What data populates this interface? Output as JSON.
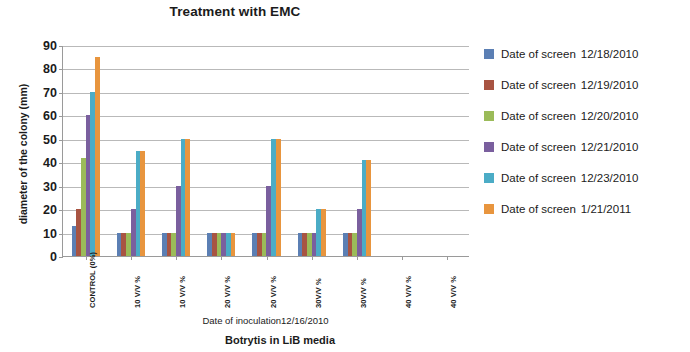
{
  "chart_data": {
    "type": "bar",
    "title": "Treatment with EMC",
    "caption": "Botrytis in LiB media",
    "xlabel": "Date of inoculation12/16/2010",
    "ylabel": "diameter of the colony (mm)",
    "ylim": [
      0,
      90
    ],
    "ytick_step": 10,
    "yticks": [
      90,
      80,
      70,
      60,
      50,
      40,
      30,
      20,
      10,
      0
    ],
    "grid": true,
    "legend_position": "right",
    "categories": [
      "CONTROL (0%)",
      "10 V/V %",
      "10 V/V %",
      "20 V/V %",
      "20 V/V %",
      "30V/V %",
      "30V/V %",
      "40 V/V %",
      "40 V/V %"
    ],
    "series": [
      {
        "name": "Date of screen",
        "date": "12/18/2010",
        "color": "#5B7FB4",
        "values": [
          13,
          10,
          10,
          10,
          10,
          10,
          10,
          0,
          0
        ]
      },
      {
        "name": "Date of screen",
        "date": "12/19/2010",
        "color": "#A85442",
        "values": [
          20,
          10,
          10,
          10,
          10,
          10,
          10,
          0,
          0
        ]
      },
      {
        "name": "Date of screen",
        "date": "12/20/2010",
        "color": "#9BBB59",
        "values": [
          42,
          10,
          10,
          10,
          10,
          10,
          10,
          0,
          0
        ]
      },
      {
        "name": "Date of screen",
        "date": "12/21/2010",
        "color": "#7A5F9E",
        "values": [
          60,
          20,
          30,
          10,
          30,
          10,
          20,
          0,
          0
        ]
      },
      {
        "name": "Date of screen",
        "date": "12/23/2010",
        "color": "#4BACC6",
        "values": [
          70,
          45,
          50,
          10,
          50,
          20,
          41,
          0,
          0
        ]
      },
      {
        "name": "Date of screen",
        "date": "1/21/2011",
        "color": "#E8953E",
        "values": [
          85,
          45,
          50,
          10,
          50,
          20,
          41,
          0,
          0
        ]
      }
    ]
  }
}
